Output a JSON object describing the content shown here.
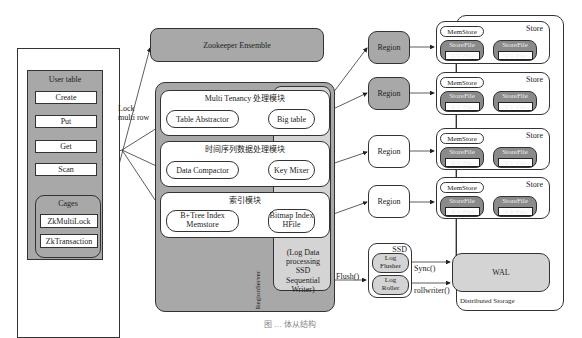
{
  "client": {
    "title": "User table",
    "buttons": [
      "Create",
      "Put",
      "Get",
      "Scan"
    ],
    "cages": {
      "title": "Cages",
      "items": [
        "ZkMultiLock",
        "ZkTransaction"
      ]
    },
    "lock_label_line1": "Lock",
    "lock_label_line2": "multi row"
  },
  "zookeeper": {
    "label": "Zookeeper Ensemble"
  },
  "region_server": {
    "label": "RegionServer",
    "modules": [
      {
        "title": "Multi Tenancy 处理模块",
        "left": "Table Abstractor",
        "right": "Big table"
      },
      {
        "title": "时间序列数据处理模块",
        "left": "Data Compactor",
        "right": "Key Mixer"
      },
      {
        "title": "索引模块",
        "left_line1": "B+Tree Index",
        "left_line2": "Memstore",
        "right_line1": "Bitmap Index",
        "right_line2": "HFile"
      }
    ],
    "log_writer": [
      "(Log Data",
      "processing SSD",
      "Sequential",
      "Writer)"
    ],
    "flush_label": "Flush()"
  },
  "regions": [
    {
      "label": "Region",
      "shaded": true
    },
    {
      "label": "Region",
      "shaded": true
    },
    {
      "label": "Region",
      "shaded": false
    },
    {
      "label": "Region",
      "shaded": false
    }
  ],
  "stores": {
    "label": "Store",
    "memstore": "MemStore",
    "storefile": "StoreFile",
    "kvfile": "KV-File",
    "count": 4
  },
  "ssd": {
    "title": "SSD",
    "log_flusher": [
      "Log",
      "Flusher"
    ],
    "log_roller": [
      "Log",
      "Roller"
    ],
    "sync_label": "Sync()",
    "rollwriter_label": "rollwriter()"
  },
  "storage": {
    "wal": "WAL",
    "label": "Distributed Storage"
  },
  "caption": "图 … 体从结构"
}
